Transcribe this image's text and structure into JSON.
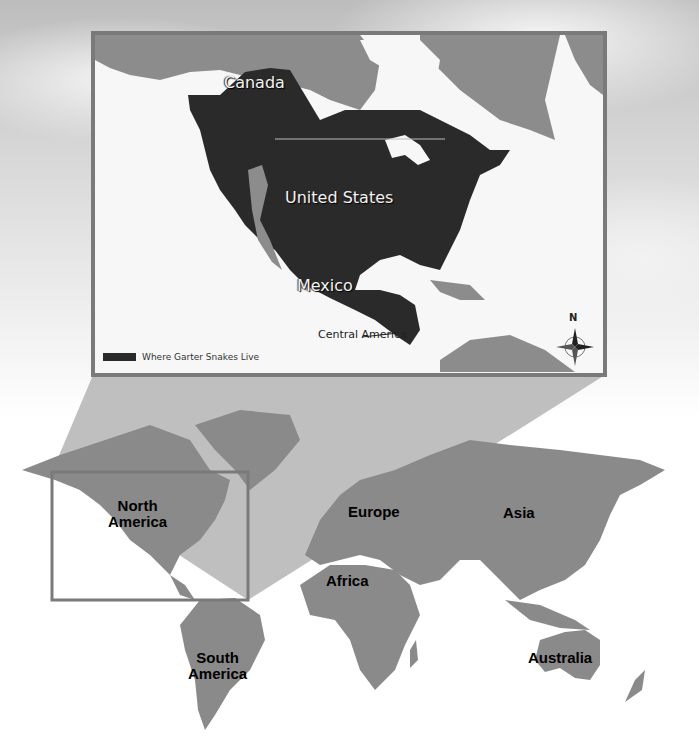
{
  "inset_map": {
    "labels": {
      "canada": "Canada",
      "united_states": "United States",
      "mexico": "Mexico",
      "central_america": "Central America"
    },
    "legend": {
      "swatch_color": "#2a2a2a",
      "text": "Where Garter Snakes Live"
    },
    "compass": {
      "north_label": "N"
    },
    "frame_color": "#7a7a7a",
    "range_color": "#2a2a2a",
    "land_color": "#8c8c8c",
    "water_color": "#f7f7f7"
  },
  "world_map": {
    "labels": {
      "north_america_line1": "North",
      "north_america_line2": "America",
      "south_america_line1": "South",
      "south_america_line2": "America",
      "europe": "Europe",
      "africa": "Africa",
      "asia": "Asia",
      "australia": "Australia"
    },
    "land_color": "#8a8a8a",
    "highlight_box_color": "#7a7a7a",
    "connector_color": "#b4b4b4"
  }
}
